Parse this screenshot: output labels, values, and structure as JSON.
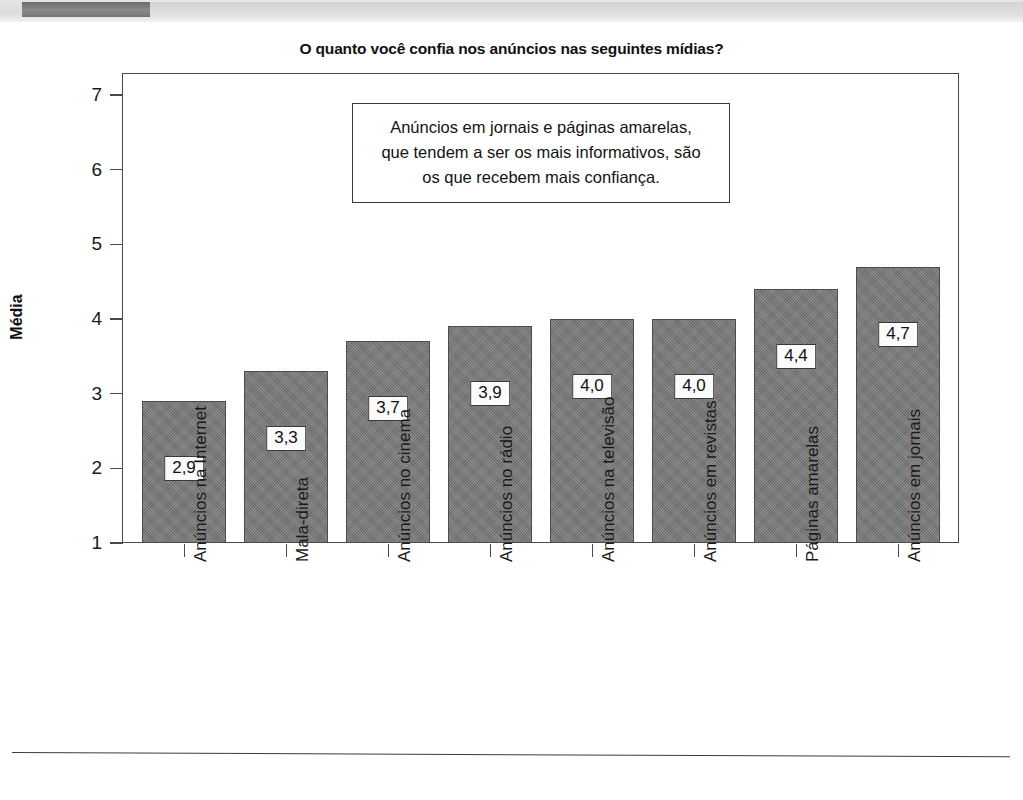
{
  "header": {
    "tab_label": "",
    "band_color": "#dcdcdc",
    "tab_color": "#7a7a7a"
  },
  "chart_data": {
    "type": "bar",
    "title": "O quanto você confia nos anúncios nas seguintes mídias?",
    "xlabel": "",
    "ylabel": "Média",
    "ylim": [
      1,
      7
    ],
    "yticks": [
      1,
      2,
      3,
      4,
      5,
      6,
      7
    ],
    "ytick_labels": [
      "1",
      "2",
      "3",
      "4",
      "5",
      "6",
      "7"
    ],
    "grid": false,
    "legend": null,
    "bar_color": "#787878",
    "categories": [
      "Anúncios na Internet",
      "Mala-direta",
      "Anúncios no cinema",
      "Anúncios no rádio",
      "Anúncios na televisão",
      "Anúncios em revistas",
      "Páginas amarelas",
      "Anúncios em jornais"
    ],
    "values": [
      2.9,
      3.3,
      3.7,
      3.9,
      4.0,
      4.0,
      4.4,
      4.7
    ],
    "value_labels": [
      "2,9",
      "3,3",
      "3,7",
      "3,9",
      "4,0",
      "4,0",
      "4,4",
      "4,7"
    ],
    "annotation": {
      "lines": [
        "Anúncios em jornais e páginas amarelas,",
        "que tendem a ser os mais informativos, são",
        "os que recebem mais confiança."
      ]
    }
  }
}
